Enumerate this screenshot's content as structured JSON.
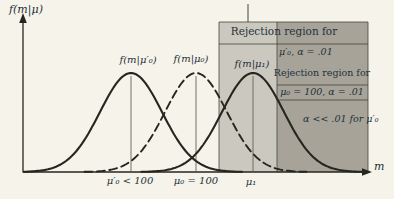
{
  "axis": {
    "y_label": "f(m|μ)",
    "x_label": "m"
  },
  "curve_labels": {
    "mu0prime": "f(m|μ′₀)",
    "mu0": "f(m|μ₀)",
    "mu1": "f(m|μ₁)"
  },
  "x_tick_labels": {
    "mu0prime": "μ′₀ < 100",
    "mu0": "μ₀ = 100",
    "mu1": "μ₁"
  },
  "annotations": {
    "band_title": "Rejection region for",
    "band_subject": "μ′₀, α = .01",
    "dark_region_title": "Rejection region for",
    "dark_region_subject": "μ₀ = 100, α = .01",
    "alpha_note": "α << .01 for μ′₀"
  },
  "colors": {
    "background": "#f6f3ea",
    "region_light": "#cbc8bf",
    "region_dark": "#a7a399",
    "ink": "#26261f",
    "text": "#243139",
    "line": "#45453d"
  },
  "chart_data": {
    "type": "line",
    "title": "",
    "x_axis": {
      "label": "m",
      "tick_labels": [
        "μ′₀ < 100",
        "μ₀ = 100",
        "μ₁"
      ]
    },
    "y_axis": {
      "label": "f(m|μ)"
    },
    "series": [
      {
        "name": "f(m|μ′₀)",
        "shape": "normal-pdf",
        "center_tick": "μ′₀ < 100",
        "line_style": "solid"
      },
      {
        "name": "f(m|μ₀)",
        "shape": "normal-pdf",
        "center_tick": "μ₀ = 100",
        "line_style": "dashed"
      },
      {
        "name": "f(m|μ₁)",
        "shape": "normal-pdf",
        "center_tick": "μ₁",
        "line_style": "solid"
      }
    ],
    "shaded_regions": [
      {
        "shade": "light",
        "label": "Rejection region for μ′₀, α = .01"
      },
      {
        "shade": "dark",
        "label": "Rejection region for μ₀ = 100, α = .01",
        "note": "α << .01 for μ′₀"
      }
    ],
    "geometry": {
      "width": 394,
      "height": 199,
      "baseline_y": 172,
      "peak_y": 73,
      "sigma": 31,
      "means_x": [
        131,
        196,
        253
      ],
      "dashed": [
        false,
        true,
        false
      ],
      "span_sigma": 3.6,
      "x_min": 24,
      "x_max": 366
    }
  }
}
